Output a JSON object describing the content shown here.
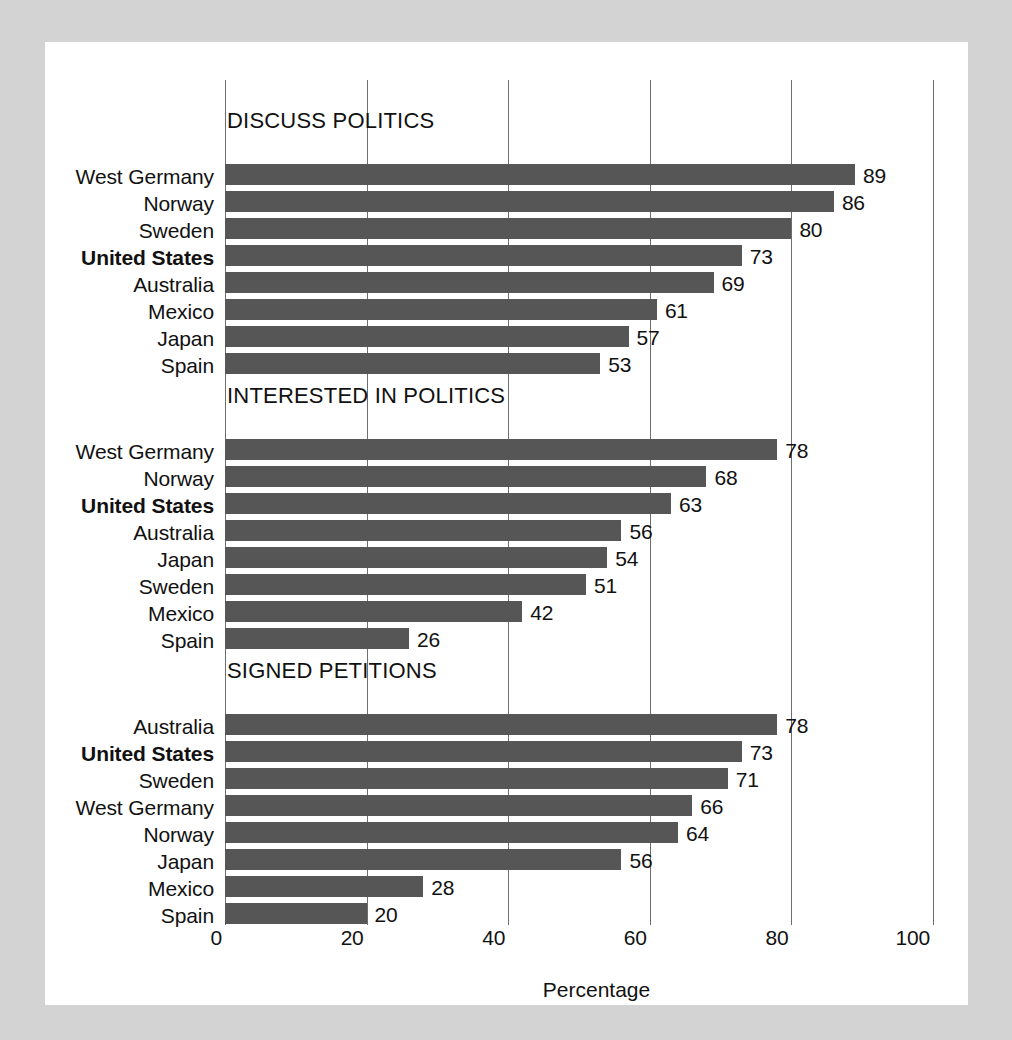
{
  "chart_data": {
    "type": "bar",
    "title": "",
    "xlabel": "Percentage",
    "ylabel": "",
    "xlim": [
      0,
      100
    ],
    "xticks": [
      0,
      20,
      40,
      60,
      80,
      100
    ],
    "xtick_labels": [
      "0",
      "20",
      "40",
      "60",
      "80",
      "100"
    ],
    "grid": true,
    "legend": "none",
    "orientation": "horizontal",
    "bar_color": "#565656",
    "highlight_country": "United States",
    "panels": [
      {
        "title": "DISCUSS POLITICS",
        "categories": [
          "West Germany",
          "Norway",
          "Sweden",
          "United States",
          "Australia",
          "Mexico",
          "Japan",
          "Spain"
        ],
        "values": [
          89,
          86,
          80,
          73,
          69,
          61,
          57,
          53
        ],
        "bold": [
          false,
          false,
          false,
          true,
          false,
          false,
          false,
          false
        ]
      },
      {
        "title": "INTERESTED IN POLITICS",
        "categories": [
          "West Germany",
          "Norway",
          "United States",
          "Australia",
          "Japan",
          "Sweden",
          "Mexico",
          "Spain"
        ],
        "values": [
          78,
          68,
          63,
          56,
          54,
          51,
          42,
          26
        ],
        "bold": [
          false,
          false,
          true,
          false,
          false,
          false,
          false,
          false
        ]
      },
      {
        "title": "SIGNED PETITIONS",
        "categories": [
          "Australia",
          "United States",
          "Sweden",
          "West Germany",
          "Norway",
          "Japan",
          "Mexico",
          "Spain"
        ],
        "values": [
          78,
          73,
          71,
          66,
          64,
          56,
          28,
          20
        ],
        "bold": [
          false,
          true,
          false,
          false,
          false,
          false,
          false,
          false
        ]
      }
    ]
  },
  "colors": {
    "page_background": "#d3d3d3",
    "card_background": "#ffffff",
    "bar": "#565656",
    "gridline": "#6e6e6e",
    "text": "#111111"
  }
}
